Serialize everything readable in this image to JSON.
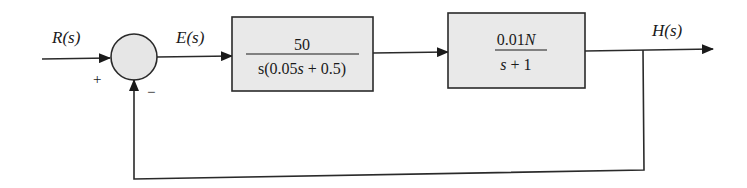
{
  "diagram": {
    "type": "feedback-control-block-diagram",
    "signals": {
      "input": "R(s)",
      "error": "E(s)",
      "output": "H(s)"
    },
    "summing_junction": {
      "plus_sign": "+",
      "minus_sign": "−"
    },
    "blocks": [
      {
        "name": "controller",
        "numerator": "50",
        "denominator_parts": [
          "s(0.05",
          "s",
          " + 0.5)"
        ]
      },
      {
        "name": "plant",
        "numerator_parts": [
          "0.01",
          "N"
        ],
        "denominator_parts": [
          "s",
          " + 1"
        ]
      }
    ],
    "feedback": "unity negative feedback from H(s) to summing junction"
  }
}
